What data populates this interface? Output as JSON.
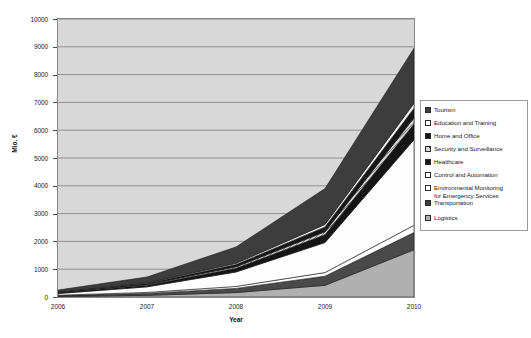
{
  "chart_data": {
    "type": "area",
    "title": "",
    "xlabel": "Year",
    "ylabel": "Mio. €",
    "x": [
      2006,
      2007,
      2008,
      2009,
      2010
    ],
    "xticklabels": [
      "2006",
      "2007",
      "2008",
      "2009",
      "2010"
    ],
    "yticklabels": [
      "0",
      "1000",
      "2000",
      "3000",
      "4000",
      "5000",
      "6000",
      "7000",
      "8000",
      "9000",
      "10000"
    ],
    "ylim": [
      0,
      10000
    ],
    "ytick_step": 1000,
    "grid": true,
    "stacked": true,
    "legend_position": "right",
    "series": [
      {
        "name": "Logistics",
        "swatch": "medium-gray",
        "color": "#b0b0b0",
        "values": [
          20,
          60,
          160,
          420,
          1700
        ]
      },
      {
        "name": "Transportation",
        "swatch": "dark-gray",
        "color": "#4a4a4a",
        "values": [
          30,
          70,
          150,
          330,
          620
        ]
      },
      {
        "name": "Environmental Monitoring\nfor Emergency Services",
        "swatch": "white",
        "color": "#ffffff",
        "values": [
          15,
          35,
          70,
          130,
          260
        ]
      },
      {
        "name": "Control and Automation",
        "swatch": "white",
        "color": "#fdfdfd",
        "values": [
          60,
          200,
          520,
          1080,
          3080
        ]
      },
      {
        "name": "Healthcare",
        "swatch": "black",
        "color": "#151515",
        "values": [
          25,
          60,
          130,
          280,
          560
        ]
      },
      {
        "name": "Security and Surveillance",
        "swatch": "hatch-gray",
        "color": "#cfcfcf",
        "values": [
          10,
          25,
          55,
          110,
          230
        ]
      },
      {
        "name": "Home and Office",
        "swatch": "black",
        "color": "#171717",
        "values": [
          15,
          35,
          80,
          170,
          340
        ]
      },
      {
        "name": "Education and Training",
        "swatch": "white",
        "color": "#f2f2f2",
        "values": [
          10,
          20,
          45,
          90,
          180
        ]
      },
      {
        "name": "Tourism",
        "swatch": "dark-gray",
        "color": "#3d3d3d",
        "values": [
          65,
          215,
          590,
          1290,
          1980
        ]
      }
    ],
    "stack_totals": [
      250,
      720,
      1800,
      3900,
      8950
    ]
  },
  "legend": {
    "items": [
      {
        "label": "Tourism",
        "swatch": "dark-gray"
      },
      {
        "label": "Education and Training",
        "swatch": "white"
      },
      {
        "label": "Home and Office",
        "swatch": "black"
      },
      {
        "label": "Security and Surveillance",
        "swatch": "hatch-gray"
      },
      {
        "label": "Healthcare",
        "swatch": "black"
      },
      {
        "label": "Control and Automation",
        "swatch": "white"
      },
      {
        "label": "Environmental Monitoring\nfor Emergency Services",
        "swatch": "white"
      },
      {
        "label": "Transportation",
        "swatch": "dark-gray"
      },
      {
        "label": "Logistics",
        "swatch": "medium-gray"
      }
    ]
  },
  "colors": {
    "plot_background": "#d8d8d8",
    "grid_line": "#7d7d7d",
    "axis_line": "#8a8a8a",
    "text": "#1a1a1a"
  }
}
